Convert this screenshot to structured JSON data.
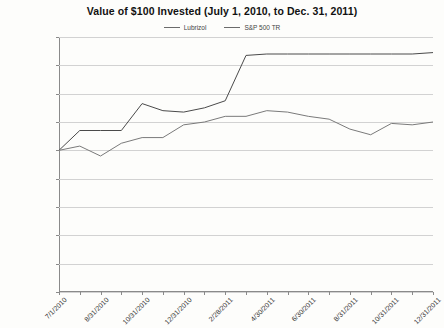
{
  "chart_data": {
    "type": "line",
    "title": "Value of $100 Invested (July 1, 2010, to Dec. 31, 2011)",
    "xlabel": "",
    "ylabel": "",
    "ylim": [
      0,
      180
    ],
    "ytick_step": 20,
    "ytick_labels": [
      "$180,00",
      "$160,00",
      "$140,00",
      "$120,00",
      "$100,00",
      "$80,00",
      "$60,00",
      "$40,00",
      "$20,00",
      "$0,00"
    ],
    "ytick_values": [
      180,
      160,
      140,
      120,
      100,
      80,
      60,
      40,
      20,
      0
    ],
    "grid": true,
    "legend_position": "top-center",
    "x": [
      "7/1/2010",
      "7/31/2010",
      "8/31/2010",
      "9/30/2010",
      "10/31/2010",
      "11/30/2010",
      "12/31/2010",
      "1/31/2011",
      "2/28/2011",
      "3/31/2011",
      "4/30/2011",
      "5/31/2011",
      "6/30/2011",
      "7/31/2011",
      "8/31/2011",
      "9/30/2011",
      "10/31/2011",
      "11/30/2011",
      "12/31/2011"
    ],
    "xtick_labels": [
      "7/1/2010",
      "8/31/2010",
      "10/31/2010",
      "12/31/2010",
      "2/28/2011",
      "4/30/2011",
      "6/30/2011",
      "8/31/2011",
      "10/31/2011",
      "12/31/2011"
    ],
    "xtick_indices": [
      0,
      2,
      4,
      6,
      8,
      10,
      12,
      14,
      16,
      18
    ],
    "series": [
      {
        "name": "Lubrizol",
        "color": "#4a4a4a",
        "values": [
          100,
          114,
          114,
          114,
          133,
          128,
          127,
          130,
          135,
          167,
          168,
          168,
          168,
          168,
          168,
          168,
          168,
          168,
          169
        ]
      },
      {
        "name": "S&P 500 TR",
        "color": "#7a7a7a",
        "values": [
          100,
          103,
          96,
          105,
          109,
          109,
          118,
          120,
          124,
          124,
          128,
          127,
          124,
          122,
          115,
          111,
          119,
          118,
          120
        ]
      }
    ]
  }
}
